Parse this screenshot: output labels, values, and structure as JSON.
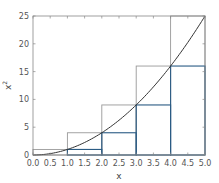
{
  "chart_data": {
    "type": "bar",
    "title": "",
    "xlabel": "x",
    "ylabel": "x^2",
    "xlim": [
      0.0,
      5.0
    ],
    "ylim": [
      0,
      25
    ],
    "xticks": [
      "0.0",
      "0.5",
      "1.0",
      "1.5",
      "2.0",
      "2.5",
      "3.0",
      "3.5",
      "4.0",
      "4.5",
      "5.0"
    ],
    "yticks": [
      "0",
      "5",
      "10",
      "15",
      "20",
      "25"
    ],
    "grid": false,
    "legend": null,
    "curve": {
      "name": "y = x^2",
      "color": "#333333",
      "x": [
        0,
        0.5,
        1,
        1.5,
        2,
        2.5,
        3,
        3.5,
        4,
        4.5,
        5
      ],
      "y": [
        0,
        0.25,
        1,
        2.25,
        4,
        6.25,
        9,
        12.25,
        16,
        20.25,
        25
      ]
    },
    "intervals": [
      [
        0,
        1
      ],
      [
        1,
        2
      ],
      [
        2,
        3
      ],
      [
        3,
        4
      ],
      [
        4,
        5
      ]
    ],
    "series": [
      {
        "name": "upper sum (right endpoints)",
        "color": "#999999",
        "values": [
          1,
          4,
          9,
          16,
          25
        ]
      },
      {
        "name": "lower sum (left endpoints)",
        "color": "#2a5b84",
        "values": [
          0,
          1,
          4,
          9,
          16
        ]
      }
    ]
  }
}
